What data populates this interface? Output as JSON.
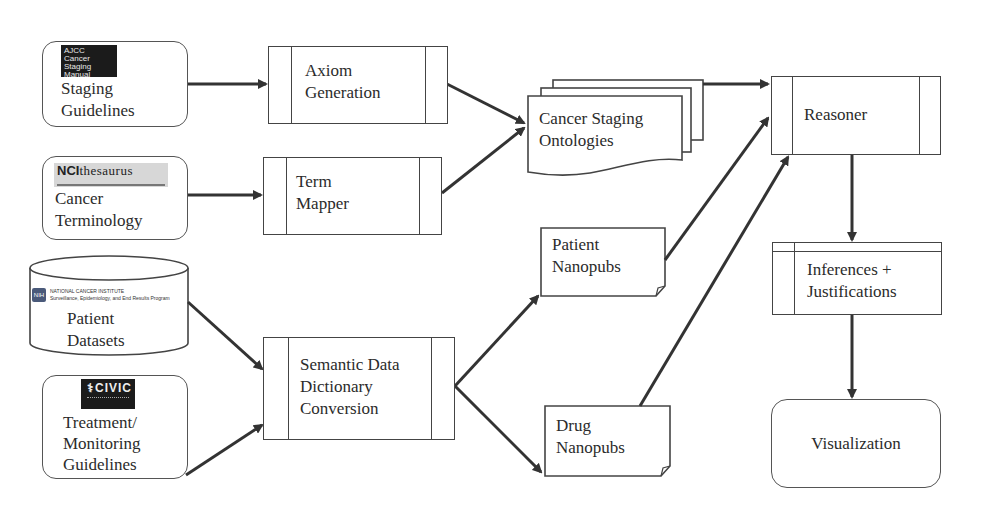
{
  "diagram": {
    "type": "flowchart",
    "nodes": {
      "staging_guidelines": {
        "label": "Staging\nGuidelines",
        "shape": "rounded-rectangle",
        "logo": {
          "name": "ajcc-logo",
          "text": "AJCC\nCancer Staging\nManual"
        }
      },
      "cancer_terminology": {
        "label": "Cancer\nTerminology",
        "shape": "rounded-rectangle",
        "logo": {
          "name": "nci-thesaurus-logo",
          "text_bold": "NCI",
          "text_rest": "thesaurus"
        }
      },
      "patient_datasets": {
        "label": "Patient\nDatasets",
        "shape": "cylinder",
        "logo": {
          "name": "nih-seer-logo",
          "badge": "NIH",
          "line1": "NATIONAL CANCER INSTITUTE",
          "line2": "Surveillance, Epidemiology, and End Results Program"
        }
      },
      "treatment_guidelines": {
        "label": "Treatment/\nMonitoring\nGuidelines",
        "shape": "rounded-rectangle",
        "logo": {
          "name": "civic-logo",
          "text": "CIVIC"
        }
      },
      "axiom_generation": {
        "label": "Axiom\nGeneration",
        "shape": "predefined-process"
      },
      "term_mapper": {
        "label": "Term\nMapper",
        "shape": "predefined-process"
      },
      "semantic_conversion": {
        "label": "Semantic Data\nDictionary\nConversion",
        "shape": "predefined-process"
      },
      "cancer_staging_ontologies": {
        "label": "Cancer Staging\nOntologies",
        "shape": "multi-document"
      },
      "patient_nanopubs": {
        "label": "Patient\nNanopubs",
        "shape": "note"
      },
      "drug_nanopubs": {
        "label": "Drug\nNanopubs",
        "shape": "note"
      },
      "reasoner": {
        "label": "Reasoner",
        "shape": "predefined-process"
      },
      "inferences": {
        "label": "Inferences +\nJustifications",
        "shape": "internal-storage"
      },
      "visualization": {
        "label": "Visualization",
        "shape": "rounded-rectangle"
      }
    },
    "edges": [
      {
        "from": "staging_guidelines",
        "to": "axiom_generation"
      },
      {
        "from": "cancer_terminology",
        "to": "term_mapper"
      },
      {
        "from": "axiom_generation",
        "to": "cancer_staging_ontologies"
      },
      {
        "from": "term_mapper",
        "to": "cancer_staging_ontologies"
      },
      {
        "from": "patient_datasets",
        "to": "semantic_conversion"
      },
      {
        "from": "treatment_guidelines",
        "to": "semantic_conversion"
      },
      {
        "from": "semantic_conversion",
        "to": "patient_nanopubs"
      },
      {
        "from": "semantic_conversion",
        "to": "drug_nanopubs"
      },
      {
        "from": "cancer_staging_ontologies",
        "to": "reasoner"
      },
      {
        "from": "patient_nanopubs",
        "to": "reasoner"
      },
      {
        "from": "drug_nanopubs",
        "to": "reasoner"
      },
      {
        "from": "reasoner",
        "to": "inferences"
      },
      {
        "from": "inferences",
        "to": "visualization"
      }
    ],
    "colors": {
      "stroke": "#444444",
      "arrow": "#333333",
      "background": "#ffffff",
      "text": "#2b2b2b"
    }
  }
}
